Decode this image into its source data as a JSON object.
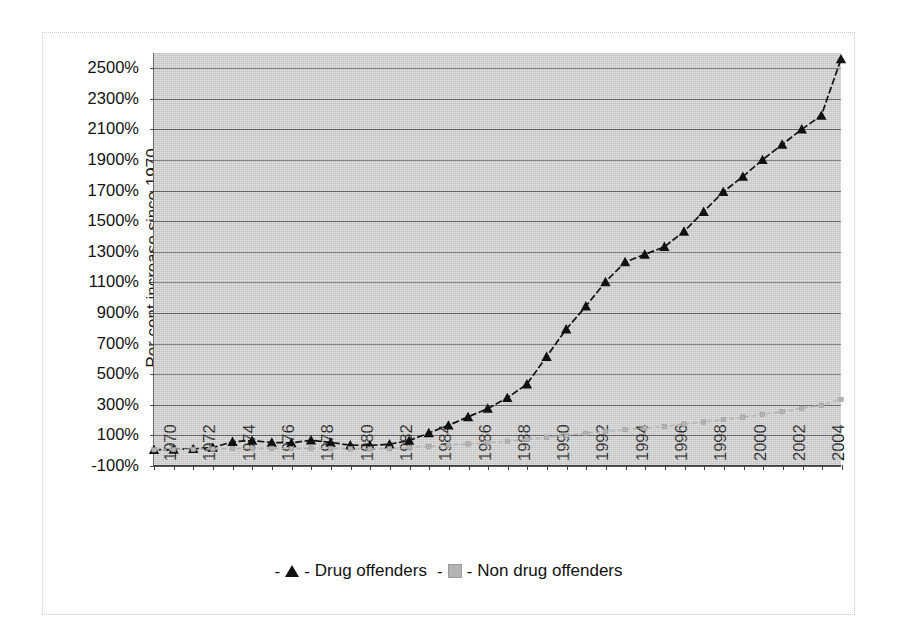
{
  "chart_data": {
    "type": "line",
    "title": "",
    "xlabel": "",
    "ylabel": "Per cent increase since 1970",
    "ylim": [
      -100,
      2600
    ],
    "ytick_labels": [
      "2500%",
      "2300%",
      "2100%",
      "1900%",
      "1700%",
      "1500%",
      "1300%",
      "1100%",
      "900%",
      "700%",
      "500%",
      "300%",
      "100%",
      "-100%"
    ],
    "ytick_values": [
      2500,
      2300,
      2100,
      1900,
      1700,
      1500,
      1300,
      1100,
      900,
      700,
      500,
      300,
      100,
      -100
    ],
    "xlim": [
      1970,
      2005
    ],
    "xtick_labels": [
      "1970",
      "1972",
      "1974",
      "1976",
      "1978",
      "1980",
      "1982",
      "1984",
      "1986",
      "1988",
      "1990",
      "1992",
      "1994",
      "1996",
      "1998",
      "2000",
      "2002",
      "2004"
    ],
    "xtick_values": [
      1970,
      1972,
      1974,
      1976,
      1978,
      1980,
      1982,
      1984,
      1986,
      1988,
      1990,
      1992,
      1994,
      1996,
      1998,
      2000,
      2002,
      2004
    ],
    "grid": true,
    "legend_position": "bottom",
    "plot_background": "#d2d2d2",
    "x": [
      1970,
      1971,
      1972,
      1973,
      1974,
      1975,
      1976,
      1977,
      1978,
      1979,
      1980,
      1981,
      1982,
      1983,
      1984,
      1985,
      1986,
      1987,
      1988,
      1989,
      1990,
      1991,
      1992,
      1993,
      1994,
      1995,
      1996,
      1997,
      1998,
      1999,
      2000,
      2001,
      2002,
      2003,
      2004,
      2005
    ],
    "series": [
      {
        "name": "Drug offenders",
        "marker": "triangle",
        "color": "#111111",
        "values": [
          0,
          2,
          6,
          14,
          52,
          60,
          48,
          45,
          62,
          48,
          30,
          28,
          36,
          60,
          110,
          160,
          215,
          270,
          340,
          430,
          610,
          790,
          940,
          1100,
          1230,
          1280,
          1330,
          1430,
          1560,
          1690,
          1790,
          1900,
          2000,
          2100,
          2190,
          2560
        ]
      },
      {
        "name": "Non drug offenders",
        "marker": "square",
        "color": "#b4b4b4",
        "values": [
          0,
          1,
          3,
          5,
          8,
          10,
          9,
          8,
          10,
          9,
          6,
          5,
          8,
          14,
          22,
          30,
          38,
          46,
          56,
          68,
          82,
          96,
          108,
          120,
          132,
          142,
          152,
          168,
          182,
          198,
          214,
          232,
          250,
          272,
          292,
          330
        ]
      }
    ]
  },
  "legend": {
    "entries": [
      {
        "dash_left": "-",
        "dash_right": "-",
        "label": "Drug offenders",
        "marker": "triangle-marker"
      },
      {
        "dash_left": "-",
        "dash_right": "-",
        "label": "Non drug offenders",
        "marker": "square-marker"
      }
    ]
  }
}
